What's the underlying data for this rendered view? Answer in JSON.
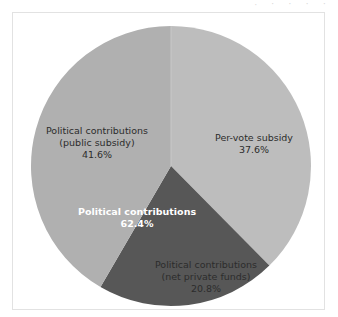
{
  "top_artifact": {
    "text": "· ˑ ˑ ˑ ˑ"
  },
  "figure": {
    "background_color": "#ffffff",
    "border_color": "#e2e2e2"
  },
  "chart_data": {
    "type": "pie",
    "title": "",
    "subtitle": "",
    "xlabel": "",
    "ylabel": "",
    "legend_position": "none",
    "grid": false,
    "start_angle_deg": 90,
    "direction": "clockwise",
    "center_px": [
      170,
      165
    ],
    "radius_px": 140,
    "labels": [
      "Per-vote subsidy",
      "Political contributions (net private funds)",
      "Political contributions (public subsidy)"
    ],
    "values": [
      37.6,
      20.8,
      41.6
    ],
    "value_suffix": "%",
    "colors": [
      "#bdbdbd",
      "#575757",
      "#b0b0b0"
    ],
    "annotations": [
      {
        "name": "combined-political-contributions",
        "text": "Political contributions",
        "value": 62.4,
        "value_text": "62.4%",
        "color": "#ffffff",
        "bold": true
      }
    ]
  },
  "slices": {
    "per_vote_subsidy": {
      "line1": "Per-vote subsidy",
      "line2": "37.6%",
      "color": "#bdbdbd",
      "value": 37.6
    },
    "net_private_funds": {
      "line1": "Political contributions",
      "line2": "(net private funds)",
      "line3": "20.8%",
      "color": "#575757",
      "value": 20.8
    },
    "public_subsidy": {
      "line1": "Political contributions",
      "line2": "(public subsidy)",
      "line3": "41.6%",
      "color": "#b0b0b0",
      "value": 41.6
    },
    "total_contributions": {
      "line1": "Political contributions",
      "line2": "62.4%",
      "color": "#ffffff",
      "value": 62.4
    }
  }
}
